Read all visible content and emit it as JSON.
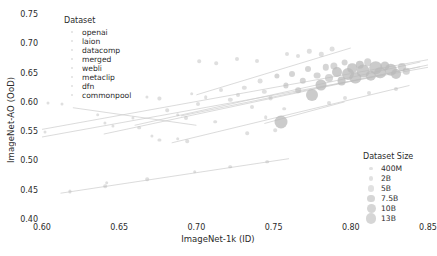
{
  "chart_data": {
    "type": "scatter",
    "title": "",
    "xlabel": "ImageNet-1k (ID)",
    "ylabel": "ImageNet-AO (OoD)",
    "xlim": [
      0.6,
      0.85
    ],
    "ylim": [
      0.4,
      0.75
    ],
    "xticks": [
      "0.60",
      "0.65",
      "0.70",
      "0.75",
      "0.80",
      "0.85"
    ],
    "xtick_values": [
      0.6,
      0.65,
      0.7,
      0.75,
      0.8,
      0.85
    ],
    "yticks": [
      "0.40",
      "0.45",
      "0.50",
      "0.55",
      "0.60",
      "0.65",
      "0.70",
      "0.75"
    ],
    "ytick_values": [
      0.4,
      0.45,
      0.5,
      0.55,
      0.6,
      0.65,
      0.7,
      0.75
    ],
    "grid": false,
    "marker_color": "#b9b9b9",
    "line_color": "#cccccc",
    "legend_position": "upper-left and lower-right",
    "size_encodes": "Dataset Size",
    "points": [
      {
        "x": 0.604,
        "y": 0.598,
        "size": 1.5
      },
      {
        "x": 0.613,
        "y": 0.596,
        "size": 1.5
      },
      {
        "x": 0.602,
        "y": 0.548,
        "size": 1.5
      },
      {
        "x": 0.636,
        "y": 0.578,
        "size": 1.8
      },
      {
        "x": 0.641,
        "y": 0.564,
        "size": 1.6
      },
      {
        "x": 0.646,
        "y": 0.559,
        "size": 1.6
      },
      {
        "x": 0.659,
        "y": 0.572,
        "size": 1.6
      },
      {
        "x": 0.663,
        "y": 0.556,
        "size": 1.8
      },
      {
        "x": 0.668,
        "y": 0.609,
        "size": 1.6
      },
      {
        "x": 0.676,
        "y": 0.606,
        "size": 1.6
      },
      {
        "x": 0.681,
        "y": 0.586,
        "size": 1.8
      },
      {
        "x": 0.688,
        "y": 0.578,
        "size": 1.8
      },
      {
        "x": 0.693,
        "y": 0.572,
        "size": 2.0
      },
      {
        "x": 0.697,
        "y": 0.614,
        "size": 1.8
      },
      {
        "x": 0.701,
        "y": 0.596,
        "size": 2.0
      },
      {
        "x": 0.706,
        "y": 0.608,
        "size": 1.8
      },
      {
        "x": 0.712,
        "y": 0.566,
        "size": 1.8
      },
      {
        "x": 0.716,
        "y": 0.62,
        "size": 2.0
      },
      {
        "x": 0.722,
        "y": 0.603,
        "size": 2.2
      },
      {
        "x": 0.727,
        "y": 0.612,
        "size": 2.0
      },
      {
        "x": 0.731,
        "y": 0.624,
        "size": 2.2
      },
      {
        "x": 0.736,
        "y": 0.592,
        "size": 2.0
      },
      {
        "x": 0.741,
        "y": 0.635,
        "size": 2.4
      },
      {
        "x": 0.744,
        "y": 0.617,
        "size": 2.2
      },
      {
        "x": 0.748,
        "y": 0.606,
        "size": 2.4
      },
      {
        "x": 0.752,
        "y": 0.644,
        "size": 2.6
      },
      {
        "x": 0.755,
        "y": 0.565,
        "size": 6.5
      },
      {
        "x": 0.758,
        "y": 0.628,
        "size": 2.6
      },
      {
        "x": 0.762,
        "y": 0.648,
        "size": 3.0
      },
      {
        "x": 0.766,
        "y": 0.62,
        "size": 2.8
      },
      {
        "x": 0.769,
        "y": 0.636,
        "size": 3.2
      },
      {
        "x": 0.772,
        "y": 0.656,
        "size": 3.0
      },
      {
        "x": 0.775,
        "y": 0.612,
        "size": 6.0
      },
      {
        "x": 0.778,
        "y": 0.645,
        "size": 3.4
      },
      {
        "x": 0.781,
        "y": 0.628,
        "size": 5.5
      },
      {
        "x": 0.784,
        "y": 0.659,
        "size": 3.2
      },
      {
        "x": 0.786,
        "y": 0.641,
        "size": 4.0
      },
      {
        "x": 0.789,
        "y": 0.662,
        "size": 3.6
      },
      {
        "x": 0.791,
        "y": 0.651,
        "size": 5.0
      },
      {
        "x": 0.794,
        "y": 0.636,
        "size": 4.4
      },
      {
        "x": 0.796,
        "y": 0.667,
        "size": 3.4
      },
      {
        "x": 0.798,
        "y": 0.648,
        "size": 6.0
      },
      {
        "x": 0.801,
        "y": 0.657,
        "size": 4.8
      },
      {
        "x": 0.803,
        "y": 0.641,
        "size": 5.6
      },
      {
        "x": 0.806,
        "y": 0.663,
        "size": 4.2
      },
      {
        "x": 0.808,
        "y": 0.652,
        "size": 6.4
      },
      {
        "x": 0.811,
        "y": 0.668,
        "size": 3.8
      },
      {
        "x": 0.813,
        "y": 0.644,
        "size": 5.2
      },
      {
        "x": 0.816,
        "y": 0.658,
        "size": 6.8
      },
      {
        "x": 0.819,
        "y": 0.65,
        "size": 5.8
      },
      {
        "x": 0.822,
        "y": 0.662,
        "size": 4.6
      },
      {
        "x": 0.826,
        "y": 0.655,
        "size": 6.2
      },
      {
        "x": 0.829,
        "y": 0.648,
        "size": 5.0
      },
      {
        "x": 0.833,
        "y": 0.66,
        "size": 4.0
      },
      {
        "x": 0.836,
        "y": 0.652,
        "size": 3.2
      },
      {
        "x": 0.759,
        "y": 0.682,
        "size": 2.0
      },
      {
        "x": 0.766,
        "y": 0.678,
        "size": 2.0
      },
      {
        "x": 0.773,
        "y": 0.686,
        "size": 2.2
      },
      {
        "x": 0.781,
        "y": 0.681,
        "size": 2.2
      },
      {
        "x": 0.788,
        "y": 0.69,
        "size": 2.4
      },
      {
        "x": 0.702,
        "y": 0.669,
        "size": 1.8
      },
      {
        "x": 0.713,
        "y": 0.666,
        "size": 1.8
      },
      {
        "x": 0.726,
        "y": 0.673,
        "size": 2.0
      },
      {
        "x": 0.739,
        "y": 0.67,
        "size": 2.0
      },
      {
        "x": 0.641,
        "y": 0.456,
        "size": 1.8
      },
      {
        "x": 0.642,
        "y": 0.462,
        "size": 1.8
      },
      {
        "x": 0.668,
        "y": 0.468,
        "size": 1.8
      },
      {
        "x": 0.699,
        "y": 0.481,
        "size": 1.8
      },
      {
        "x": 0.722,
        "y": 0.489,
        "size": 1.8
      },
      {
        "x": 0.746,
        "y": 0.498,
        "size": 1.8
      },
      {
        "x": 0.618,
        "y": 0.447,
        "size": 1.6
      },
      {
        "x": 0.688,
        "y": 0.537,
        "size": 1.8
      },
      {
        "x": 0.694,
        "y": 0.533,
        "size": 1.8
      },
      {
        "x": 0.733,
        "y": 0.546,
        "size": 1.8
      },
      {
        "x": 0.751,
        "y": 0.552,
        "size": 1.8
      },
      {
        "x": 0.786,
        "y": 0.598,
        "size": 2.0
      },
      {
        "x": 0.796,
        "y": 0.606,
        "size": 2.0
      },
      {
        "x": 0.812,
        "y": 0.615,
        "size": 2.0
      },
      {
        "x": 0.829,
        "y": 0.622,
        "size": 2.0
      },
      {
        "x": 0.671,
        "y": 0.542,
        "size": 1.6
      },
      {
        "x": 0.676,
        "y": 0.535,
        "size": 1.6
      },
      {
        "x": 0.745,
        "y": 0.574,
        "size": 1.8
      },
      {
        "x": 0.757,
        "y": 0.588,
        "size": 1.8
      }
    ],
    "trend_lines": [
      {
        "x1": 0.6,
        "y1": 0.553,
        "x2": 0.85,
        "y2": 0.672
      },
      {
        "x1": 0.6,
        "y1": 0.54,
        "x2": 0.85,
        "y2": 0.659
      },
      {
        "x1": 0.64,
        "y1": 0.545,
        "x2": 0.85,
        "y2": 0.663
      },
      {
        "x1": 0.66,
        "y1": 0.56,
        "x2": 0.845,
        "y2": 0.668
      },
      {
        "x1": 0.69,
        "y1": 0.576,
        "x2": 0.845,
        "y2": 0.66
      },
      {
        "x1": 0.7,
        "y1": 0.612,
        "x2": 0.8,
        "y2": 0.692
      },
      {
        "x1": 0.612,
        "y1": 0.444,
        "x2": 0.76,
        "y2": 0.503
      },
      {
        "x1": 0.684,
        "y1": 0.53,
        "x2": 0.838,
        "y2": 0.628
      },
      {
        "x1": 0.744,
        "y1": 0.563,
        "x2": 0.796,
        "y2": 0.6
      },
      {
        "x1": 0.62,
        "y1": 0.59,
        "x2": 0.7,
        "y2": 0.56
      }
    ]
  },
  "legend_dataset": {
    "title": "Dataset",
    "items": [
      {
        "label": "openai"
      },
      {
        "label": "laion"
      },
      {
        "label": "datacomp"
      },
      {
        "label": "merged"
      },
      {
        "label": "webli"
      },
      {
        "label": "metaclip"
      },
      {
        "label": "dfn"
      },
      {
        "label": "commonpool"
      }
    ]
  },
  "legend_size": {
    "title": "Dataset Size",
    "items": [
      {
        "label": "400M",
        "r": 1.6
      },
      {
        "label": "2B",
        "r": 2.4
      },
      {
        "label": "5B",
        "r": 3.1
      },
      {
        "label": "7.5B",
        "r": 3.8
      },
      {
        "label": "10B",
        "r": 4.5
      },
      {
        "label": "13B",
        "r": 5.2
      }
    ]
  }
}
